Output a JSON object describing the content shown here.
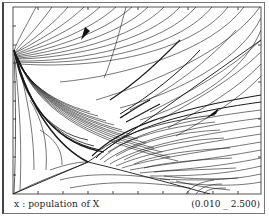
{
  "figure": {
    "type": "phase-portrait",
    "x_axis": {
      "variable": "x",
      "label": "x : population of X",
      "range_text": "(0.010 _ 2.500)",
      "min": 0.01,
      "max": 2.5
    },
    "saddle_point_px": [
      88,
      162
    ],
    "arrows": [
      {
        "name": "upper-flow-arrow",
        "position_px": [
          86,
          33
        ],
        "direction": "down-left"
      },
      {
        "name": "lower-flow-arrow",
        "position_px": [
          213,
          113
        ],
        "direction": "down-left"
      }
    ],
    "colors": {
      "background": "#ffffff",
      "lines": "#1a1a1a",
      "frame": "#555555"
    }
  }
}
